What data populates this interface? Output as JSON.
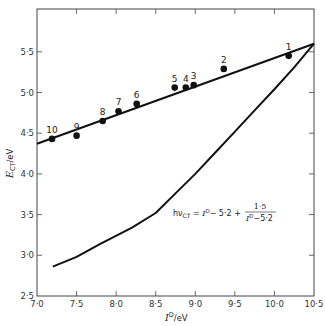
{
  "chart_data": {
    "type": "scatter",
    "title": "",
    "xlabel": "I^D/eV",
    "ylabel": "E_CT/eV",
    "xlim": [
      7.0,
      10.5
    ],
    "ylim": [
      2.5,
      6.0
    ],
    "grid": false,
    "x_ticks": [
      "7·0",
      "7·5",
      "8·0",
      "8·5",
      "9·0",
      "9·5",
      "10·0",
      "10·5"
    ],
    "y_ticks": [
      "2·5",
      "3·0",
      "3·5",
      "4·0",
      "4·5",
      "5·0",
      "5·5"
    ],
    "series": [
      {
        "name": "measured points",
        "kind": "scatter",
        "points": [
          {
            "label": "1",
            "x": 10.18,
            "y": 5.45
          },
          {
            "label": "2",
            "x": 9.36,
            "y": 5.29
          },
          {
            "label": "3",
            "x": 8.98,
            "y": 5.09
          },
          {
            "label": "4",
            "x": 8.88,
            "y": 5.06
          },
          {
            "label": "5",
            "x": 8.74,
            "y": 5.06
          },
          {
            "label": "6",
            "x": 8.26,
            "y": 4.86
          },
          {
            "label": "7",
            "x": 8.03,
            "y": 4.77
          },
          {
            "label": "8",
            "x": 7.83,
            "y": 4.65
          },
          {
            "label": "9",
            "x": 7.5,
            "y": 4.47
          },
          {
            "label": "10",
            "x": 7.19,
            "y": 4.43
          }
        ]
      },
      {
        "name": "linear fit",
        "kind": "line",
        "x": [
          7.0,
          10.5
        ],
        "y": [
          4.37,
          5.6
        ]
      },
      {
        "name": "hν_CT = I^D − 5·2 + 1·5/(I^D − 5·2)",
        "kind": "line",
        "x": [
          7.2,
          7.5,
          7.8,
          8.2,
          8.5,
          8.75,
          9.0,
          9.25,
          9.5,
          9.75,
          10.0,
          10.25,
          10.5
        ],
        "y": [
          2.86,
          2.98,
          3.14,
          3.34,
          3.52,
          3.76,
          4.0,
          4.26,
          4.52,
          4.78,
          5.04,
          5.31,
          5.6
        ]
      }
    ],
    "annotations": [
      {
        "text": "hν_CT = I^D − 5·2 + 1·5 / (I^D − 5·2)",
        "x": 9.0,
        "y": 3.7
      }
    ]
  },
  "axes": {
    "x_title_main": "I",
    "x_title_sup": "D",
    "x_title_unit": "/eV",
    "y_title_main": "E",
    "y_title_sub": "CT",
    "y_title_unit": "/eV"
  },
  "formula": {
    "lhs": "hν",
    "lhs_sub": "CT",
    "eq": " = ",
    "term1_I": "I",
    "term1_sup": "D",
    "term1_rest": "− 5·2 +",
    "num": "1·5",
    "den_I": "I",
    "den_sup": "D",
    "den_rest": "−5·2"
  }
}
